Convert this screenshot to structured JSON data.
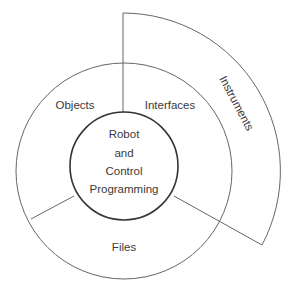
{
  "diagram": {
    "center": {
      "lines": [
        "Robot",
        "and",
        "Control",
        "Programming"
      ]
    },
    "segments": {
      "objects": "Objects",
      "interfaces": "Interfaces",
      "files": "Files"
    },
    "outer_arc": {
      "label": "Instruments"
    },
    "colors": {
      "stroke": "#555555",
      "text": "#3a3a3a",
      "background": "#ffffff"
    }
  }
}
